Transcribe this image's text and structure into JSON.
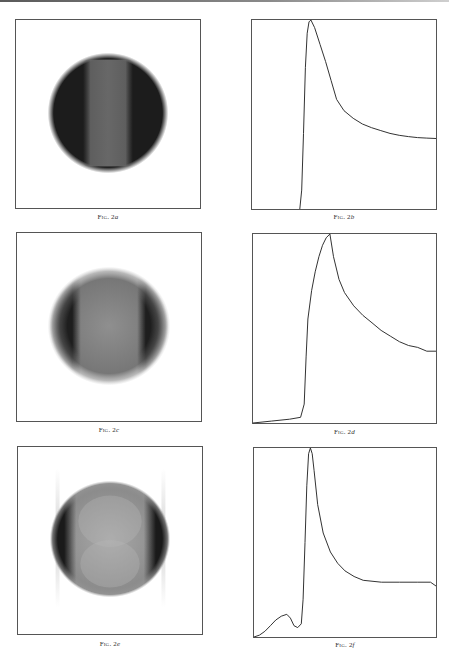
{
  "figures": [
    {
      "id": "2a",
      "caption_prefix": "Fig. 2",
      "caption_label": "a",
      "type": "image",
      "description": "dark disc with lighter vertical central band"
    },
    {
      "id": "2b",
      "caption_prefix": "Fig. 2",
      "caption_label": "b",
      "type": "line"
    },
    {
      "id": "2c",
      "caption_prefix": "Fig. 2",
      "caption_label": "c",
      "type": "image",
      "description": "disc with dark left/right edges and light grey center"
    },
    {
      "id": "2d",
      "caption_prefix": "Fig. 2",
      "caption_label": "d",
      "type": "line"
    },
    {
      "id": "2e",
      "caption_prefix": "Fig. 2",
      "caption_label": "e",
      "type": "image",
      "description": "light disc with dark crescent edges and faint side streaks"
    },
    {
      "id": "2f",
      "caption_prefix": "Fig. 2",
      "caption_label": "f",
      "type": "line"
    }
  ],
  "chart_data": [
    {
      "id": "2b",
      "type": "line",
      "title": "Fig. 2b",
      "xlabel": "",
      "ylabel": "",
      "xlim": [
        0,
        1
      ],
      "ylim": [
        0,
        1
      ],
      "grid": false,
      "x": [
        0.26,
        0.27,
        0.28,
        0.29,
        0.3,
        0.31,
        0.32,
        0.34,
        0.37,
        0.4,
        0.43,
        0.46,
        0.5,
        0.55,
        0.6,
        0.65,
        0.7,
        0.75,
        0.8,
        0.85,
        0.9,
        0.95,
        1.0
      ],
      "y": [
        0.0,
        0.1,
        0.4,
        0.75,
        0.93,
        0.99,
        1.0,
        0.96,
        0.87,
        0.78,
        0.68,
        0.58,
        0.52,
        0.48,
        0.45,
        0.43,
        0.415,
        0.4,
        0.39,
        0.383,
        0.378,
        0.375,
        0.373
      ]
    },
    {
      "id": "2d",
      "type": "line",
      "title": "Fig. 2d",
      "xlabel": "",
      "ylabel": "",
      "xlim": [
        0,
        1
      ],
      "ylim": [
        0,
        1
      ],
      "grid": false,
      "x": [
        0.0,
        0.1,
        0.2,
        0.26,
        0.28,
        0.29,
        0.3,
        0.32,
        0.34,
        0.36,
        0.38,
        0.4,
        0.42,
        0.44,
        0.47,
        0.5,
        0.55,
        0.6,
        0.65,
        0.7,
        0.75,
        0.8,
        0.85,
        0.9,
        0.95,
        1.0
      ],
      "y": [
        0.0,
        0.01,
        0.02,
        0.03,
        0.1,
        0.35,
        0.55,
        0.7,
        0.8,
        0.88,
        0.94,
        0.98,
        1.0,
        0.88,
        0.76,
        0.69,
        0.62,
        0.57,
        0.53,
        0.49,
        0.46,
        0.43,
        0.41,
        0.4,
        0.38,
        0.38
      ]
    },
    {
      "id": "2f",
      "type": "line",
      "title": "Fig. 2f",
      "xlabel": "",
      "ylabel": "",
      "xlim": [
        0,
        1
      ],
      "ylim": [
        0,
        1
      ],
      "grid": false,
      "x": [
        0.0,
        0.03,
        0.06,
        0.09,
        0.12,
        0.15,
        0.18,
        0.2,
        0.22,
        0.24,
        0.26,
        0.27,
        0.28,
        0.29,
        0.3,
        0.31,
        0.32,
        0.33,
        0.35,
        0.38,
        0.42,
        0.46,
        0.5,
        0.55,
        0.6,
        0.7,
        0.8,
        0.9,
        0.97,
        1.0
      ],
      "y": [
        0.0,
        0.01,
        0.03,
        0.06,
        0.09,
        0.11,
        0.12,
        0.1,
        0.06,
        0.05,
        0.07,
        0.2,
        0.5,
        0.8,
        0.97,
        1.0,
        0.97,
        0.88,
        0.7,
        0.55,
        0.45,
        0.39,
        0.35,
        0.32,
        0.3,
        0.29,
        0.29,
        0.29,
        0.29,
        0.27
      ]
    }
  ]
}
